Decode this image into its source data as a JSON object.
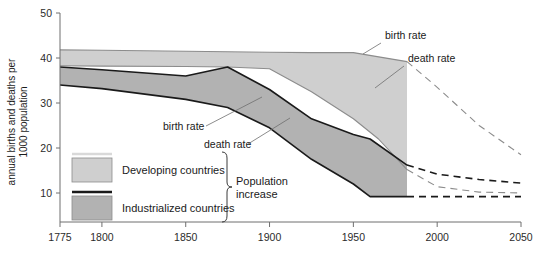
{
  "chart_data": {
    "type": "area",
    "title": "",
    "xlabel": "",
    "ylabel": "annual births and deaths per 1000 population",
    "ylabel_line1": "annual births and deaths per",
    "ylabel_line2": "1000 population",
    "xlim": [
      1775,
      2050
    ],
    "ylim": [
      7,
      50
    ],
    "yticks": [
      10,
      20,
      30,
      40,
      50
    ],
    "xticks": [
      1775,
      1800,
      1850,
      1900,
      1950,
      2000,
      2050
    ],
    "grid": false,
    "projection_starts": 1982,
    "series": [
      {
        "name": "Developing countries birth rate",
        "group": "developing",
        "role": "birth rate",
        "style": "solid-then-dashed",
        "x": [
          1775,
          1800,
          1850,
          1875,
          1900,
          1925,
          1950,
          1982,
          2000,
          2025,
          2050
        ],
        "y": [
          41.8,
          41.7,
          41.5,
          41.4,
          41.3,
          41.2,
          41.2,
          39.2,
          33.5,
          25.0,
          18.5
        ]
      },
      {
        "name": "Developing countries death rate",
        "group": "developing",
        "role": "death rate",
        "style": "solid-then-dashed",
        "x": [
          1775,
          1800,
          1850,
          1875,
          1900,
          1925,
          1950,
          1965,
          1982,
          2000,
          2025,
          2050
        ],
        "y": [
          38.3,
          38.2,
          38.1,
          38.0,
          37.6,
          32.5,
          26.5,
          22.0,
          15.2,
          11.4,
          10.2,
          10.0
        ]
      },
      {
        "name": "Industrialized countries birth rate",
        "group": "industrialized",
        "role": "birth rate",
        "style": "solid-then-dashed",
        "x": [
          1775,
          1800,
          1850,
          1875,
          1900,
          1925,
          1950,
          1960,
          1982,
          2000,
          2025,
          2050
        ],
        "y": [
          38.0,
          37.4,
          36.0,
          38.0,
          33.0,
          26.5,
          23.0,
          22.0,
          16.2,
          14.2,
          13.0,
          12.2
        ]
      },
      {
        "name": "Industrialized countries death rate",
        "group": "industrialized",
        "role": "death rate",
        "style": "solid-then-dashed",
        "x": [
          1775,
          1800,
          1850,
          1875,
          1900,
          1925,
          1950,
          1960,
          1982,
          2000,
          2025,
          2050
        ],
        "y": [
          34.0,
          33.2,
          30.8,
          29.0,
          24.5,
          17.5,
          12.0,
          9.2,
          9.2,
          9.2,
          9.2,
          9.2
        ]
      }
    ],
    "annotations": [
      {
        "id": "birth-rate-developing",
        "text": "birth rate",
        "x": 385,
        "y": 39,
        "leader": [
          [
            381,
            43
          ],
          [
            363,
            54
          ]
        ]
      },
      {
        "id": "death-rate-developing",
        "text": "death rate",
        "x": 408,
        "y": 62,
        "leader": [
          [
            404,
            66
          ],
          [
            375,
            88
          ]
        ]
      },
      {
        "id": "birth-rate-industrial",
        "text": "birth rate",
        "x": 163,
        "y": 130,
        "leader": [
          [
            206,
            126
          ],
          [
            262,
            97
          ]
        ]
      },
      {
        "id": "death-rate-industrial",
        "text": "death rate",
        "x": 204,
        "y": 148,
        "leader": [
          [
            248,
            144
          ],
          [
            290,
            118
          ]
        ]
      }
    ],
    "legend": {
      "position": "inside-lower-left",
      "bracket_label_line1": "Population",
      "bracket_label_line2": "increase",
      "items": [
        {
          "label": "Developing countries",
          "fill": "#cfcfcf",
          "edge": "#d9d9d9",
          "swatch": "band-light"
        },
        {
          "label": "Industrialized countries",
          "fill": "#b2b2b2",
          "edge": "#1a1a1a",
          "swatch": "band-dark"
        }
      ]
    },
    "colors": {
      "developing_fill": "#cfcfcf",
      "industrialized_fill": "#b2b2b2",
      "overlap_fill": "#9a9a9a",
      "line_dark": "#1a1a1a",
      "line_gray": "#8c8c8c",
      "axis": "#6f6f6f",
      "background": "#ffffff"
    }
  }
}
